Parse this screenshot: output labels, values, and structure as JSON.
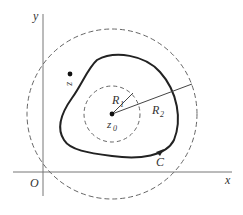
{
  "diagram": {
    "axes": {
      "x_label": "x",
      "y_label": "y",
      "origin_label": "O"
    },
    "center": {
      "label": "z",
      "subscript": "0"
    },
    "point": {
      "label": "z"
    },
    "contour": {
      "label": "C"
    },
    "radii": [
      {
        "label": "R",
        "subscript": "1"
      },
      {
        "label": "R",
        "subscript": "2"
      }
    ],
    "colors": {
      "stroke": "#333333",
      "axis": "#777777",
      "dashed": "#666666"
    }
  }
}
